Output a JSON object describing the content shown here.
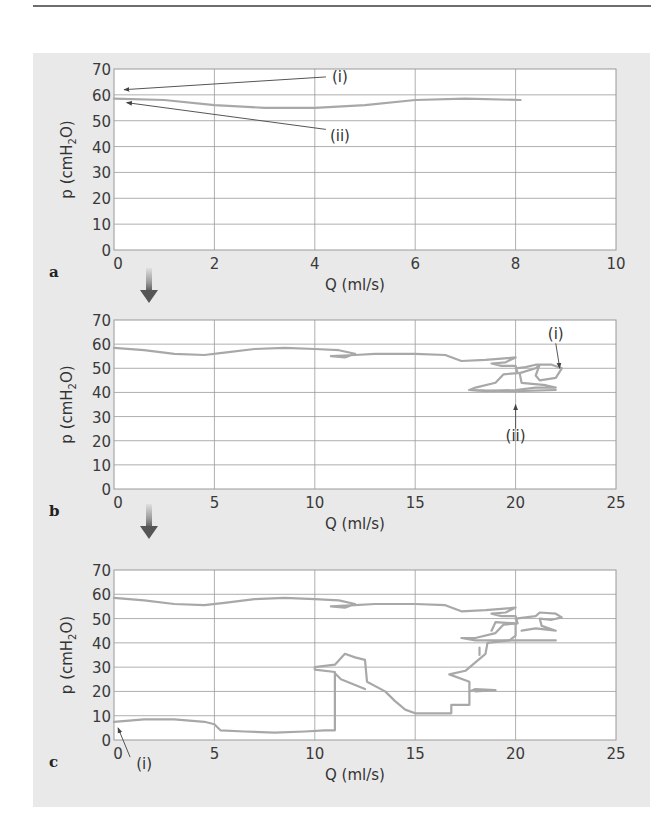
{
  "figure": {
    "panel_background": "#e9e9e9",
    "plot_background": "#ffffff",
    "grid_color": "#9a9a9a",
    "curve_color": "#a8a8a8",
    "arrow_color": "#555555"
  },
  "chart_data": [
    {
      "panel": "a",
      "type": "line",
      "title": "",
      "xlabel": "Q (ml/s)",
      "ylabel": "p (cmH2O)",
      "xlim": [
        0,
        10
      ],
      "ylim": [
        0,
        70
      ],
      "xticks": [
        0,
        2,
        4,
        6,
        8,
        10
      ],
      "yticks": [
        0,
        10,
        20,
        30,
        40,
        50,
        60,
        70
      ],
      "grid": true,
      "annotations": [
        {
          "label": "(i)",
          "text_at": [
            4.5,
            65
          ],
          "arrow_to": [
            0.2,
            62
          ]
        },
        {
          "label": "(ii)",
          "text_at": [
            4.5,
            42
          ],
          "arrow_to": [
            0.25,
            57
          ]
        }
      ],
      "series": [
        {
          "name": "pressure-flow",
          "points": [
            [
              0,
              58.5
            ],
            [
              1,
              58
            ],
            [
              2,
              56
            ],
            [
              3,
              55
            ],
            [
              4,
              55
            ],
            [
              5,
              56
            ],
            [
              6,
              58
            ],
            [
              7,
              58.5
            ],
            [
              8.1,
              58
            ]
          ]
        }
      ]
    },
    {
      "panel": "b",
      "type": "line",
      "title": "",
      "xlabel": "Q (ml/s)",
      "ylabel": "p (cmH2O)",
      "xlim": [
        0,
        25
      ],
      "ylim": [
        0,
        70
      ],
      "xticks": [
        0,
        5,
        10,
        15,
        20,
        25
      ],
      "yticks": [
        0,
        10,
        20,
        30,
        40,
        50,
        60,
        70
      ],
      "grid": true,
      "annotations": [
        {
          "label": "(i)",
          "text_at": [
            22,
            62
          ],
          "arrow_to": [
            22.2,
            50
          ]
        },
        {
          "label": "(ii)",
          "text_at": [
            20,
            20
          ],
          "arrow_to": [
            20,
            35
          ]
        }
      ],
      "series": [
        {
          "name": "pressure-flow",
          "points": [
            [
              0,
              58.5
            ],
            [
              1.5,
              57.5
            ],
            [
              3,
              56
            ],
            [
              4.5,
              55.5
            ],
            [
              5.5,
              56.5
            ],
            [
              7,
              58
            ],
            [
              8.5,
              58.5
            ],
            [
              10,
              58
            ],
            [
              11.2,
              57.5
            ],
            [
              12,
              56
            ],
            [
              11.5,
              54.5
            ],
            [
              10.8,
              55
            ],
            [
              12,
              55.5
            ],
            [
              13,
              56
            ],
            [
              15,
              56
            ],
            [
              16.5,
              55.5
            ],
            [
              17.3,
              53
            ],
            [
              18.5,
              53.5
            ],
            [
              19.3,
              54
            ],
            [
              20,
              54.5
            ],
            [
              19.5,
              52.5
            ],
            [
              18.8,
              52
            ],
            [
              19.3,
              51
            ],
            [
              20,
              51
            ],
            [
              20.1,
              48
            ],
            [
              19.4,
              47.5
            ],
            [
              19,
              44
            ],
            [
              18,
              42
            ],
            [
              17.7,
              41
            ],
            [
              18.5,
              40.5
            ],
            [
              20,
              41
            ],
            [
              21,
              42
            ],
            [
              22,
              42
            ],
            [
              21.5,
              43
            ],
            [
              20.3,
              44
            ],
            [
              20.2,
              48
            ],
            [
              21,
              50
            ],
            [
              21.2,
              51.5
            ],
            [
              21,
              47
            ],
            [
              21.2,
              45
            ],
            [
              22,
              46
            ],
            [
              22.3,
              50
            ],
            [
              21.8,
              51.5
            ],
            [
              21,
              51.5
            ],
            [
              20.5,
              50.5
            ],
            [
              20,
              50
            ]
          ]
        },
        {
          "name": "pressure-flow-lower",
          "points": [
            [
              17.7,
              41
            ],
            [
              20,
              40.5
            ],
            [
              22,
              41
            ]
          ]
        }
      ]
    },
    {
      "panel": "c",
      "type": "line",
      "title": "",
      "xlabel": "Q (ml/s)",
      "ylabel": "p (cmH2O)",
      "xlim": [
        0,
        25
      ],
      "ylim": [
        0,
        70
      ],
      "xticks": [
        0,
        5,
        10,
        15,
        20,
        25
      ],
      "yticks": [
        0,
        10,
        20,
        30,
        40,
        50,
        60,
        70
      ],
      "grid": true,
      "annotations": [
        {
          "label": "(i)",
          "text_at": [
            1.5,
            -12
          ],
          "arrow_to": [
            0.2,
            5
          ]
        }
      ],
      "series": [
        {
          "name": "upper-branch",
          "points": [
            [
              0,
              58.5
            ],
            [
              1.5,
              57.5
            ],
            [
              3,
              56
            ],
            [
              4.5,
              55.5
            ],
            [
              5.5,
              56.5
            ],
            [
              7,
              58
            ],
            [
              8.5,
              58.5
            ],
            [
              10,
              58
            ],
            [
              11.2,
              57.5
            ],
            [
              12,
              56
            ],
            [
              11.5,
              54.5
            ],
            [
              10.8,
              55
            ],
            [
              12,
              55.5
            ],
            [
              13,
              56
            ],
            [
              15,
              56
            ],
            [
              16.5,
              55.5
            ],
            [
              17.3,
              53
            ],
            [
              18.5,
              53.5
            ],
            [
              19.3,
              54
            ],
            [
              20,
              54.5
            ],
            [
              19.5,
              52.5
            ],
            [
              18.8,
              52
            ],
            [
              19.3,
              51
            ],
            [
              20,
              51
            ],
            [
              20.1,
              48
            ],
            [
              19.4,
              47.5
            ],
            [
              19,
              44
            ],
            [
              18,
              42
            ],
            [
              17.3,
              42
            ],
            [
              18,
              41
            ],
            [
              19.8,
              41
            ],
            [
              22,
              41
            ]
          ]
        },
        {
          "name": "upper-loop",
          "points": [
            [
              20,
              50
            ],
            [
              21,
              51
            ],
            [
              21.2,
              52.5
            ],
            [
              22,
              52
            ],
            [
              22.3,
              50.5
            ],
            [
              21.8,
              49.5
            ],
            [
              21.2,
              50
            ],
            [
              21.3,
              47
            ],
            [
              22,
              45
            ],
            [
              21,
              46
            ],
            [
              20.3,
              45
            ]
          ]
        },
        {
          "name": "lower-branch",
          "points": [
            [
              0,
              7.5
            ],
            [
              1.5,
              8.5
            ],
            [
              3,
              8.5
            ],
            [
              4.5,
              7.5
            ],
            [
              5,
              6.5
            ],
            [
              5.3,
              4
            ],
            [
              6.5,
              3.5
            ],
            [
              8,
              3
            ],
            [
              9.5,
              3.5
            ],
            [
              10.5,
              4
            ],
            [
              11,
              4
            ],
            [
              11,
              28
            ],
            [
              10,
              29
            ],
            [
              10,
              30
            ],
            [
              11,
              31
            ],
            [
              11.5,
              35.5
            ],
            [
              12,
              34
            ],
            [
              12.5,
              33
            ],
            [
              12.6,
              24
            ],
            [
              13.5,
              20
            ],
            [
              14,
              16
            ],
            [
              14.5,
              12.5
            ],
            [
              15,
              11
            ],
            [
              16.8,
              11
            ],
            [
              16.8,
              14.5
            ],
            [
              17.7,
              14.5
            ],
            [
              17.7,
              24
            ],
            [
              16.7,
              27
            ],
            [
              17.5,
              28.5
            ],
            [
              18,
              32
            ],
            [
              18.5,
              35.5
            ],
            [
              18.6,
              40
            ],
            [
              19.7,
              41
            ],
            [
              20,
              43
            ],
            [
              20,
              48
            ],
            [
              19,
              48.5
            ],
            [
              18.8,
              45
            ]
          ]
        },
        {
          "name": "lower-spur",
          "points": [
            [
              17.7,
              20
            ],
            [
              18,
              21
            ],
            [
              19,
              20.5
            ],
            [
              18,
              20
            ]
          ]
        },
        {
          "name": "lower-step",
          "points": [
            [
              11,
              27.5
            ],
            [
              11.3,
              25
            ],
            [
              12.5,
              21
            ]
          ]
        },
        {
          "name": "small-tick",
          "points": [
            [
              18.2,
              38
            ],
            [
              18.2,
              35
            ]
          ]
        }
      ]
    }
  ],
  "panels": [
    {
      "letter": "a",
      "xlabel": "Q (ml/s)",
      "ylabel_main": "p (cmH",
      "ylabel_sub": "2",
      "ylabel_end": "O)"
    },
    {
      "letter": "b",
      "xlabel": "Q (ml/s)",
      "ylabel_main": "p (cmH",
      "ylabel_sub": "2",
      "ylabel_end": "O)"
    },
    {
      "letter": "c",
      "xlabel": "Q (ml/s)",
      "ylabel_main": "p (cmH",
      "ylabel_sub": "2",
      "ylabel_end": "O)"
    }
  ]
}
